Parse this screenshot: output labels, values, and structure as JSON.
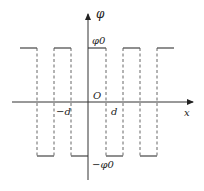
{
  "diagram": {
    "type": "square-wave-potential",
    "axes": {
      "x_label": "x",
      "y_label": "φ",
      "origin_label": "O"
    },
    "y_ticks": {
      "positive": "φ0",
      "negative": "−φ0"
    },
    "x_ticks": {
      "negative": "−d",
      "positive": "d"
    },
    "colors": {
      "line": "#333333",
      "dashed": "#555555",
      "background": "#ffffff"
    }
  }
}
